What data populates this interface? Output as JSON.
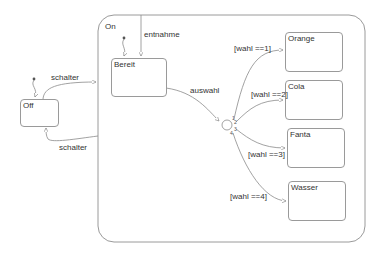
{
  "diagram": {
    "type": "statechart",
    "colors": {
      "line": "#9a9a9a",
      "text": "#333333",
      "background": "#ffffff"
    },
    "superstate": {
      "name": "On"
    },
    "states": [
      {
        "id": "off",
        "name": "Off"
      },
      {
        "id": "bereit",
        "name": "Bereit"
      },
      {
        "id": "orange",
        "name": "Orange"
      },
      {
        "id": "cola",
        "name": "Cola"
      },
      {
        "id": "fanta",
        "name": "Fanta"
      },
      {
        "id": "wasser",
        "name": "Wasser"
      }
    ],
    "transitions": [
      {
        "from": "off",
        "to": "on",
        "label": "schalter"
      },
      {
        "from": "on",
        "to": "off",
        "label": "schalter"
      },
      {
        "from": "on-top",
        "to": "bereit",
        "label": "entnahme"
      },
      {
        "from": "bereit",
        "to": "junction",
        "label": "auswahl"
      },
      {
        "from": "junction",
        "to": "orange",
        "label": "[wahl ==1]",
        "order": "1"
      },
      {
        "from": "junction",
        "to": "cola",
        "label": "[wahl ==2]",
        "order": "2"
      },
      {
        "from": "junction",
        "to": "fanta",
        "label": "[wahl ==3]",
        "order": "3"
      },
      {
        "from": "junction",
        "to": "wasser",
        "label": "[wahl ==4]",
        "order": "4"
      }
    ]
  }
}
